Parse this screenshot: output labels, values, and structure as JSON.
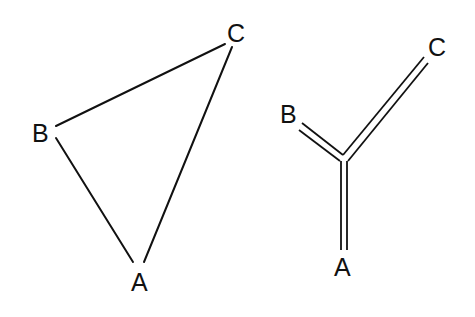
{
  "diagrams": [
    {
      "name": "triangle-graph",
      "labels": {
        "a": "A",
        "b": "B",
        "c": "C"
      },
      "edges": [
        "B-C",
        "B-A",
        "C-A"
      ]
    },
    {
      "name": "tree-graph",
      "labels": {
        "a": "A",
        "b": "B",
        "c": "C"
      },
      "edges": [
        "center-B",
        "center-C",
        "center-A"
      ],
      "edge_style": "double-line"
    }
  ],
  "colors": {
    "line": "#111111",
    "background": "#ffffff"
  }
}
